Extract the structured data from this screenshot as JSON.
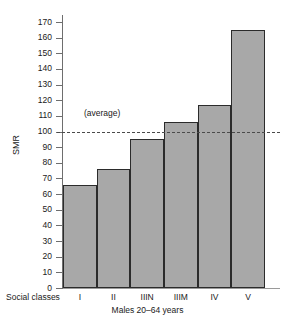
{
  "chart_data": {
    "type": "bar",
    "title": "",
    "categories": [
      "I",
      "II",
      "IIIN",
      "IIIM",
      "IV",
      "V"
    ],
    "values": [
      66,
      76,
      95,
      106,
      117,
      165
    ],
    "xlabel": "Males 20–64 years",
    "x_category_prefix": "Social classes",
    "ylabel": "SMR",
    "ylim": [
      0,
      175
    ],
    "ytick_values": [
      0,
      10,
      20,
      30,
      40,
      50,
      60,
      70,
      80,
      90,
      100,
      110,
      120,
      130,
      140,
      150,
      160,
      170
    ],
    "ytick_labels": [
      "0",
      "10",
      "20",
      "30",
      "40",
      "50",
      "60",
      "70",
      "80",
      "90",
      "100",
      "110",
      "120",
      "130",
      "140",
      "150",
      "160",
      "170"
    ],
    "grid": false,
    "legend": false,
    "annotations": [
      {
        "name": "average-line",
        "label": "(average)",
        "value": 100,
        "style": "dashed"
      }
    ],
    "colors": {
      "bar_fill": "#a8a8a8",
      "bar_edge": "#2b2b2b",
      "axis": "#6e6e6e",
      "average_line": "#4a4a4a",
      "background": "#ffffff",
      "text": "#1a1a1a"
    }
  }
}
